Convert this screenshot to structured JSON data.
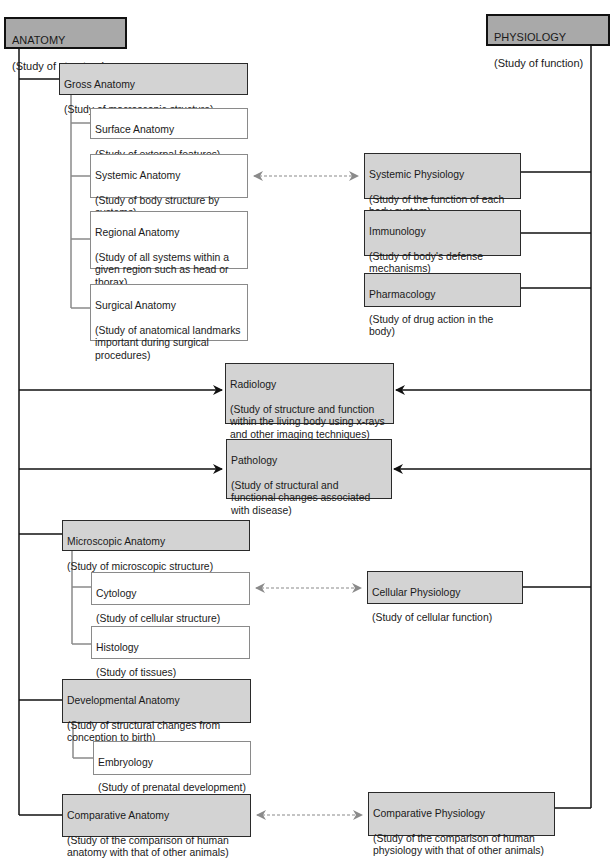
{
  "anatomy": {
    "title": "ANATOMY",
    "desc": "(Study of structure)"
  },
  "physiology": {
    "title": "PHYSIOLOGY",
    "desc": "(Study of function)"
  },
  "gross": {
    "title": "Gross Anatomy",
    "desc": "(Study of macroscopic structure)"
  },
  "surface": {
    "title": "Surface Anatomy",
    "desc": "(Study of external features)"
  },
  "systemic_anat": {
    "title": "Systemic Anatomy",
    "desc": "(Study of body structure by\n systems)"
  },
  "regional": {
    "title": "Regional Anatomy",
    "desc": "(Study of all systems within a\n given region such as head or\n thorax)"
  },
  "surgical": {
    "title": "Surgical Anatomy",
    "desc": "(Study of anatomical landmarks\n important during surgical\n procedures)"
  },
  "systemic_phys": {
    "title": "Systemic Physiology",
    "desc": "(Study of the function of each\n body system)"
  },
  "immunology": {
    "title": "Immunology",
    "desc": "(Study of body's defense\n mechanisms)"
  },
  "pharmacology": {
    "title": "Pharmacology",
    "desc": "(Study of drug action in the body)"
  },
  "radiology": {
    "title": "Radiology",
    "desc": "(Study of structure and function\n within the living body using x-rays\n and other imaging techniques)"
  },
  "pathology": {
    "title": "Pathology",
    "desc": "(Study of structural and\n functional changes associated\n with disease)"
  },
  "microscopic": {
    "title": "Microscopic Anatomy",
    "desc": "(Study of microscopic structure)"
  },
  "cytology": {
    "title": "Cytology",
    "desc": "(Study of cellular structure)"
  },
  "histology": {
    "title": "Histology",
    "desc": "(Study of tissues)"
  },
  "cellular_phys": {
    "title": "Cellular Physiology",
    "desc": "(Study of cellular function)"
  },
  "developmental": {
    "title": "Developmental Anatomy",
    "desc": "(Study of structural changes from\n conception to birth)"
  },
  "embryology": {
    "title": "Embryology",
    "desc": "(Study of prenatal development)"
  },
  "comparative_anat": {
    "title": "Comparative Anatomy",
    "desc": "(Study of the comparison of human\n anatomy with that of other animals)"
  },
  "comparative_phys": {
    "title": "Comparative Physiology",
    "desc": "(Study of the comparison of human\n physiology with that of other animals)"
  },
  "colors": {
    "root_fill": "#a9a9a9",
    "major_fill": "#d3d3d3",
    "minor_fill": "#ffffff",
    "dashed_arrow": "#8a8a8a"
  }
}
